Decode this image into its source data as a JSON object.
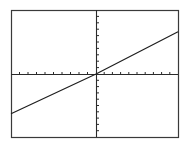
{
  "chart_data": {
    "type": "line",
    "title": "",
    "xlabel": "",
    "ylabel": "",
    "xlim": [
      -10,
      10
    ],
    "ylim": [
      -10,
      10
    ],
    "xscl": 1,
    "yscl": 1,
    "grid": false,
    "legend": null,
    "series": [
      {
        "name": "y = (2/3)x",
        "equation": "y = 0.67x",
        "x": [
          -10,
          0,
          10
        ],
        "y": [
          -6.3,
          0,
          6.6
        ]
      }
    ],
    "x_ticks_left": 10,
    "x_ticks_right": 10,
    "y_ticks_top": 10,
    "y_ticks_bottom": 10
  },
  "style": {
    "frame_color": "#3a3a3a",
    "axis_color": "#2a2a2a",
    "line_color": "#1e1e1e",
    "background": "#ffffff"
  },
  "layout": {
    "frame": {
      "left": 11,
      "top": 10,
      "right": 178,
      "bottom": 137
    },
    "origin": {
      "x": 96,
      "y": 74
    }
  }
}
